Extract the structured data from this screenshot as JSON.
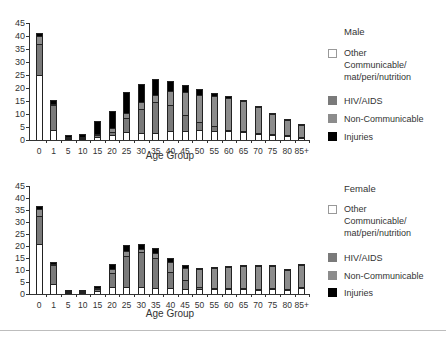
{
  "chart_data": [
    {
      "type": "bar",
      "stacked": true,
      "title": "Male",
      "xlabel": "Age Group",
      "ylabel": "",
      "ylim": [
        0,
        45
      ],
      "yticks": [
        0,
        5,
        10,
        15,
        20,
        25,
        30,
        35,
        40,
        45
      ],
      "grid": false,
      "legend_position": "right",
      "categories": [
        "0",
        "1",
        "5",
        "10",
        "15",
        "20",
        "25",
        "30",
        "35",
        "40",
        "45",
        "50",
        "55",
        "60",
        "65",
        "70",
        "75",
        "80",
        "85+"
      ],
      "series": [
        {
          "name": "Other Communicable/ mat/peri/nutrition",
          "color": "#ffffff",
          "values": [
            25,
            4,
            0.3,
            0.3,
            1,
            2,
            3,
            2.5,
            2.5,
            3.5,
            3.5,
            4,
            3.5,
            3.5,
            3,
            2.5,
            2,
            1.5,
            1
          ]
        },
        {
          "name": "HIV/AIDS",
          "color": "#7a7a7a",
          "values": [
            12,
            9.5,
            0.5,
            0.5,
            1,
            1,
            5.5,
            9.5,
            12,
            10,
            6,
            3,
            2,
            0.5,
            0.3,
            0.3,
            0.2,
            0.1,
            0.1
          ]
        },
        {
          "name": "Non-Communicable",
          "color": "#8c8c8c",
          "values": [
            3,
            0.5,
            0.2,
            0.4,
            0.5,
            1.5,
            2,
            2.5,
            3,
            5.5,
            9,
            10.5,
            11.5,
            12,
            11.7,
            10,
            8.2,
            6.3,
            4.8
          ]
        },
        {
          "name": "Injuries",
          "color": "#000000",
          "values": [
            1,
            1.5,
            1,
            1,
            5,
            6.5,
            8,
            7,
            6,
            3.8,
            2.5,
            2,
            1,
            1,
            0.5,
            0.2,
            0.1,
            0.1,
            0.1
          ]
        }
      ]
    },
    {
      "type": "bar",
      "stacked": true,
      "title": "Female",
      "xlabel": "Age Group",
      "ylabel": "",
      "ylim": [
        0,
        45
      ],
      "yticks": [
        0,
        5,
        10,
        15,
        20,
        25,
        30,
        35,
        40,
        45
      ],
      "grid": false,
      "legend_position": "right",
      "categories": [
        "0",
        "1",
        "5",
        "10",
        "15",
        "20",
        "25",
        "30",
        "35",
        "40",
        "45",
        "50",
        "55",
        "60",
        "65",
        "70",
        "75",
        "80",
        "85+"
      ],
      "series": [
        {
          "name": "Other Communicable/ mat/peri/nutrition",
          "color": "#ffffff",
          "values": [
            21,
            4,
            0.3,
            0.3,
            1.2,
            2.8,
            3,
            2.8,
            2.5,
            2.5,
            2.2,
            2,
            2,
            2,
            2,
            1.8,
            2,
            1.8,
            2.5
          ]
        },
        {
          "name": "HIV/AIDS",
          "color": "#7a7a7a",
          "values": [
            11.5,
            8,
            0.7,
            0.6,
            0.8,
            6,
            13,
            14.5,
            12.5,
            6.5,
            3.5,
            1,
            0.5,
            0.3,
            0.2,
            0.2,
            0.2,
            0.1,
            0.1
          ]
        },
        {
          "name": "Non-Communicable",
          "color": "#8c8c8c",
          "values": [
            3,
            0.5,
            0.2,
            0.2,
            0.5,
            1.5,
            2,
            1.5,
            2,
            4.5,
            5.3,
            7.5,
            8.3,
            9,
            9.5,
            10,
            9.6,
            8.4,
            9.7
          ]
        },
        {
          "name": "Injuries",
          "color": "#000000",
          "values": [
            1,
            1,
            0.5,
            0.5,
            1,
            2,
            2.5,
            2.2,
            2,
            1.5,
            1,
            0.5,
            0.4,
            0.2,
            0.3,
            0.2,
            0.2,
            0.2,
            0.2
          ]
        }
      ]
    }
  ],
  "charts": [
    {
      "title": "Male",
      "xlabel": "Age Group",
      "legend": [
        {
          "label": "Other Communicable/ mat/peri/nutrition",
          "lines": [
            "Other",
            "Communicable/",
            "mat/peri/nutrition"
          ]
        },
        {
          "label": "HIV/AIDS"
        },
        {
          "label": "Non-Communicable"
        },
        {
          "label": "Injuries"
        }
      ]
    },
    {
      "title": "Female",
      "xlabel": "Age Group",
      "legend": [
        {
          "label": "Other Communicable/ mat/peri/nutrition",
          "lines": [
            "Other",
            "Communicable/",
            "mat/peri/nutrition"
          ]
        },
        {
          "label": "HIV/AIDS"
        },
        {
          "label": "Non-Communicable"
        },
        {
          "label": "Injuries"
        }
      ]
    }
  ]
}
